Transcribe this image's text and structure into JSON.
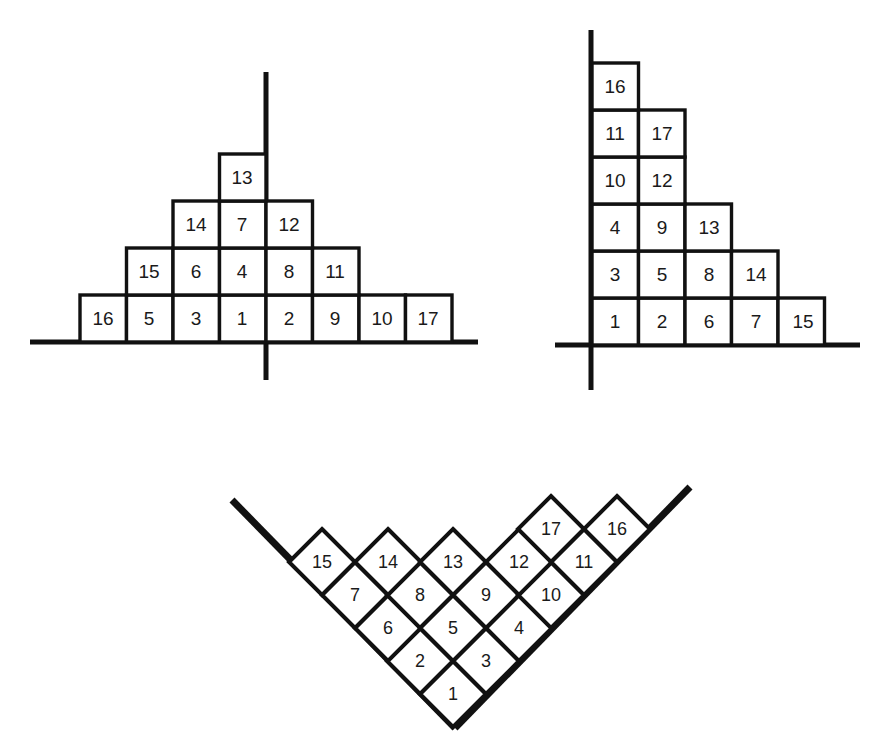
{
  "figure": {
    "background": "#ffffff",
    "ink": "#111111",
    "panels": [
      {
        "id": "pyramid",
        "name": "centered-pyramid-diagram",
        "axis": {
          "vertical": true,
          "horizontal": true
        },
        "rows": [
          {
            "index": 0,
            "labels": [
              "16",
              "5",
              "3",
              "1",
              "2",
              "9",
              "10",
              "17"
            ]
          },
          {
            "index": 1,
            "labels": [
              "15",
              "6",
              "4",
              "8",
              "11"
            ]
          },
          {
            "index": 2,
            "labels": [
              "14",
              "7",
              "12"
            ]
          },
          {
            "index": 3,
            "labels": [
              "13"
            ]
          }
        ]
      },
      {
        "id": "staircase",
        "name": "corner-staircase-diagram",
        "axis": {
          "vertical": true,
          "horizontal": true
        },
        "rows": [
          {
            "index": 0,
            "labels": [
              "1",
              "2",
              "6",
              "7",
              "15"
            ]
          },
          {
            "index": 1,
            "labels": [
              "3",
              "5",
              "8",
              "14"
            ]
          },
          {
            "index": 2,
            "labels": [
              "4",
              "9",
              "13"
            ]
          },
          {
            "index": 3,
            "labels": [
              "10",
              "12"
            ]
          },
          {
            "index": 4,
            "labels": [
              "11",
              "17"
            ]
          },
          {
            "index": 5,
            "labels": [
              "16"
            ]
          }
        ]
      },
      {
        "id": "diamond",
        "name": "diagonal-wedge-diagram",
        "axis": {
          "left_arm": true,
          "right_arm": true
        },
        "rows": [
          {
            "index": 0,
            "labels": [
              "1"
            ]
          },
          {
            "index": 1,
            "labels": [
              "2",
              "3"
            ]
          },
          {
            "index": 2,
            "labels": [
              "6",
              "5",
              "4"
            ]
          },
          {
            "index": 3,
            "labels": [
              "7",
              "8",
              "9",
              "10"
            ]
          },
          {
            "index": 4,
            "labels": [
              "15",
              "14",
              "13",
              "12",
              "11"
            ]
          },
          {
            "index": 5,
            "labels": [
              "17",
              "16"
            ]
          }
        ]
      }
    ]
  },
  "cells": {
    "pyramid": [
      {
        "n": "16",
        "cx": 103,
        "cy": 318
      },
      {
        "n": "5",
        "cx": 149,
        "cy": 318
      },
      {
        "n": "3",
        "cx": 196,
        "cy": 318
      },
      {
        "n": "1",
        "cx": 242,
        "cy": 318
      },
      {
        "n": "2",
        "cx": 289,
        "cy": 318
      },
      {
        "n": "9",
        "cx": 335,
        "cy": 318
      },
      {
        "n": "10",
        "cx": 382,
        "cy": 318
      },
      {
        "n": "17",
        "cx": 428,
        "cy": 318
      },
      {
        "n": "15",
        "cx": 149,
        "cy": 271
      },
      {
        "n": "6",
        "cx": 196,
        "cy": 271
      },
      {
        "n": "4",
        "cx": 242,
        "cy": 271
      },
      {
        "n": "8",
        "cx": 289,
        "cy": 271
      },
      {
        "n": "11",
        "cx": 335,
        "cy": 271
      },
      {
        "n": "14",
        "cx": 196,
        "cy": 224
      },
      {
        "n": "7",
        "cx": 242,
        "cy": 224
      },
      {
        "n": "12",
        "cx": 289,
        "cy": 224
      },
      {
        "n": "13",
        "cx": 242,
        "cy": 177
      }
    ],
    "staircase": [
      {
        "n": "1",
        "cx": 615,
        "cy": 321
      },
      {
        "n": "2",
        "cx": 662,
        "cy": 321
      },
      {
        "n": "6",
        "cx": 709,
        "cy": 321
      },
      {
        "n": "7",
        "cx": 756,
        "cy": 321
      },
      {
        "n": "15",
        "cx": 803,
        "cy": 321
      },
      {
        "n": "3",
        "cx": 615,
        "cy": 274
      },
      {
        "n": "5",
        "cx": 662,
        "cy": 274
      },
      {
        "n": "8",
        "cx": 709,
        "cy": 274
      },
      {
        "n": "14",
        "cx": 756,
        "cy": 274
      },
      {
        "n": "4",
        "cx": 615,
        "cy": 227
      },
      {
        "n": "9",
        "cx": 662,
        "cy": 227
      },
      {
        "n": "13",
        "cx": 709,
        "cy": 227
      },
      {
        "n": "10",
        "cx": 615,
        "cy": 180
      },
      {
        "n": "12",
        "cx": 662,
        "cy": 180
      },
      {
        "n": "11",
        "cx": 615,
        "cy": 133
      },
      {
        "n": "17",
        "cx": 662,
        "cy": 133
      },
      {
        "n": "16",
        "cx": 615,
        "cy": 86
      }
    ],
    "diamond": [
      {
        "n": "1",
        "cx": 453,
        "cy": 694
      },
      {
        "n": "2",
        "cx": 420,
        "cy": 661
      },
      {
        "n": "3",
        "cx": 486,
        "cy": 661
      },
      {
        "n": "6",
        "cx": 388,
        "cy": 628
      },
      {
        "n": "5",
        "cx": 453,
        "cy": 628
      },
      {
        "n": "4",
        "cx": 519,
        "cy": 628
      },
      {
        "n": "7",
        "cx": 355,
        "cy": 595
      },
      {
        "n": "8",
        "cx": 420,
        "cy": 595
      },
      {
        "n": "9",
        "cx": 486,
        "cy": 595
      },
      {
        "n": "10",
        "cx": 551,
        "cy": 595
      },
      {
        "n": "15",
        "cx": 322,
        "cy": 562
      },
      {
        "n": "14",
        "cx": 388,
        "cy": 562
      },
      {
        "n": "13",
        "cx": 453,
        "cy": 562
      },
      {
        "n": "12",
        "cx": 519,
        "cy": 562
      },
      {
        "n": "11",
        "cx": 584,
        "cy": 562
      },
      {
        "n": "17",
        "cx": 551,
        "cy": 529
      },
      {
        "n": "16",
        "cx": 617,
        "cy": 529
      }
    ]
  }
}
